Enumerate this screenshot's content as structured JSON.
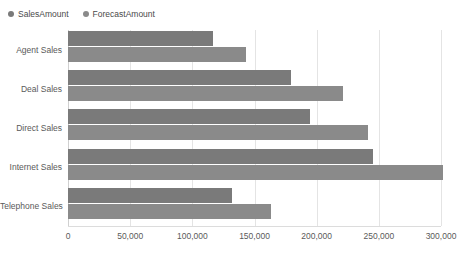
{
  "legend": {
    "position": "top-left",
    "items": [
      {
        "label": "SalesAmount",
        "color": "#7a7a7a"
      },
      {
        "label": "ForecastAmount",
        "color": "#8a8a8a"
      }
    ]
  },
  "chart_data": {
    "type": "bar",
    "orientation": "horizontal",
    "title": "",
    "xlabel": "",
    "ylabel": "",
    "categories": [
      "Agent Sales",
      "Deal Sales",
      "Direct Sales",
      "Internet Sales",
      "Telephone Sales"
    ],
    "series": [
      {
        "name": "SalesAmount",
        "color": "#7a7a7a",
        "values": [
          117000,
          179000,
          195000,
          245000,
          132000
        ]
      },
      {
        "name": "ForecastAmount",
        "color": "#8a8a8a",
        "values": [
          143000,
          221000,
          241000,
          302000,
          163000
        ]
      }
    ],
    "xlim": [
      0,
      300000
    ],
    "xticks": [
      0,
      50000,
      100000,
      150000,
      200000,
      250000,
      300000
    ],
    "xticklabels": [
      "0",
      "50,000",
      "100,000",
      "150,000",
      "200,000",
      "250,000",
      "300,000"
    ],
    "grid": true,
    "gridline_color": "#e4e4e4",
    "legend_position": "top-left"
  }
}
